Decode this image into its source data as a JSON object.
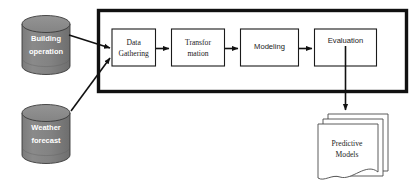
{
  "diagram": {
    "colors": {
      "cylinder_fill": "#808080",
      "cylinder_top": "#8d8d8d",
      "cylinder_stroke": "#3a3a3a",
      "cylinder_text": "#ffffff",
      "box_fill": "#ffffff",
      "box_stroke": "#1a1a1a",
      "frame_stroke": "#111111",
      "document_stroke": "#4a4a4a",
      "arrow_color": "#111111",
      "background": "#ffffff"
    },
    "data_sources": [
      {
        "id": "building-operation",
        "shape": "cylinder",
        "line1": "Building",
        "line2": "operation"
      },
      {
        "id": "weather-forecast",
        "shape": "cylinder",
        "line1": "Weather",
        "line2": "forecast"
      }
    ],
    "pipeline": {
      "container_name": "process-pipeline-frame",
      "steps": [
        {
          "id": "data-gathering",
          "line1": "Data",
          "line2": "Gathering",
          "font": "serif"
        },
        {
          "id": "transformation",
          "line1": "Transfor",
          "line2": "mation",
          "font": "serif"
        },
        {
          "id": "modeling",
          "line1": "Modeling",
          "line2": "",
          "font": "sans"
        },
        {
          "id": "evaluation",
          "line1": "Evaluation",
          "line2": "",
          "font": "sans"
        }
      ]
    },
    "output": {
      "id": "predictive-models",
      "shape": "document-stack",
      "stack_count": 3,
      "line1": "Predictive",
      "line2": "Models"
    }
  }
}
